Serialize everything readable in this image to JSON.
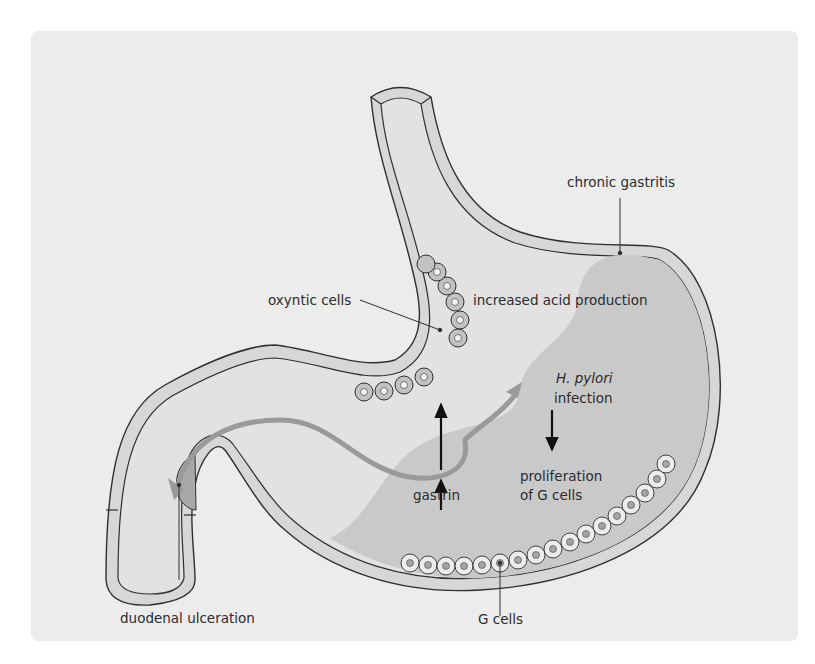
{
  "figure": {
    "colors": {
      "background": "#ececec",
      "wall": "#d7d7d7",
      "lumen": "#e2e2e2",
      "gastritis_region": "#c9c9c9",
      "outline": "#2f2f2f",
      "flow_arrow": "#9a9a9a",
      "text": "#2b2b2b"
    }
  },
  "labels": {
    "chronic_gastritis": "chronic gastritis",
    "oxyntic_cells": "oxyntic cells",
    "increased_acid": "increased acid production",
    "h_pylori": "H. pylori",
    "infection": "infection",
    "proliferation": "proliferation",
    "of_g_cells": "of G cells",
    "gastrin": "gastrin",
    "duodenal_ulceration": "duodenal ulceration",
    "g_cells": "G cells"
  }
}
